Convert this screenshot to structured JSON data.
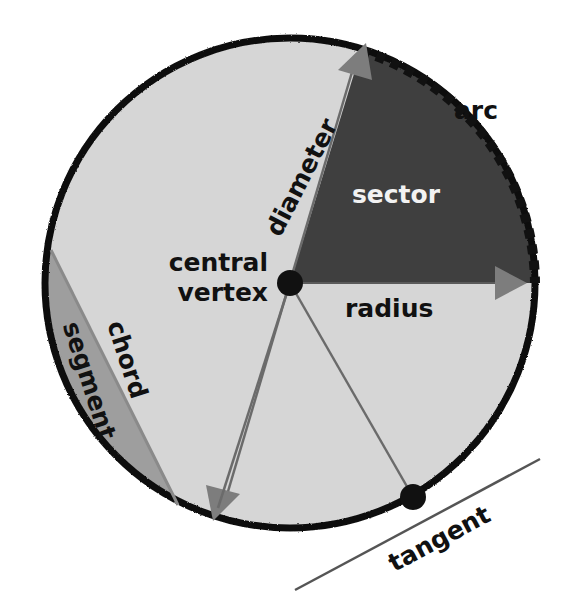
{
  "figure": {
    "kind": "circle-geometry-diagram",
    "canvas": {
      "width": 565,
      "height": 601,
      "background": "#ffffff"
    },
    "circle": {
      "center_x": 290,
      "center_y": 283,
      "radius": 245,
      "fill": "#d6d6d6",
      "stroke": "#111111",
      "stroke_width": 7
    },
    "sector": {
      "fill": "#3f3f3f",
      "start_angle_deg": 0,
      "end_angle_deg": 73,
      "label": "sector",
      "label_color": "#f2f2f2",
      "label_x": 395,
      "label_y": 196
    },
    "segment": {
      "fill": "#9e9e9e",
      "label": "segment",
      "label_rotation_deg": 72,
      "label_x": 88,
      "label_y": 381
    },
    "arc": {
      "label": "arc",
      "label_color": "#111111",
      "label_x": 476,
      "label_y": 112,
      "stroke": "#111111",
      "dash": "9 7",
      "stroke_width": 9
    },
    "radius": {
      "label": "radius",
      "label_color": "#111111",
      "label_x": 345,
      "label_y": 309,
      "arrow_fill": "#7d7d7d",
      "from_x": 290,
      "from_y": 283,
      "to_x": 534,
      "to_y": 283
    },
    "diameter": {
      "label": "diameter",
      "label_color": "#111111",
      "label_rotation_deg": -63,
      "label_x": 303,
      "label_y": 178,
      "arrow_fill": "#7d7d7d",
      "from_x": 362,
      "from_y": 49,
      "to_x": 218,
      "to_y": 516
    },
    "chord": {
      "label": "chord",
      "label_color": "#111111",
      "label_rotation_deg": 72,
      "label_x": 126,
      "label_y": 360
    },
    "tangent": {
      "label": "tangent",
      "label_color": "#111111",
      "label_rotation_deg": 27,
      "label_x": 414,
      "label_y": 540,
      "point_x": 413,
      "point_y": 497,
      "stroke": "#555555"
    },
    "central_vertex": {
      "label_line_1": "central",
      "label_line_2": "vertex",
      "label_color": "#111111",
      "label_x": 270,
      "label_y": 268,
      "dot_x": 290,
      "dot_y": 283,
      "dot_radius": 13,
      "dot_fill": "#111111"
    },
    "guide_lines": {
      "stroke": "#6b6b6b",
      "stroke_width": 2.5
    }
  },
  "labels": {
    "arc": "arc",
    "sector": "sector",
    "radius": "radius",
    "diameter": "diameter",
    "chord": "chord",
    "segment": "segment",
    "tangent": "tangent",
    "central_line_1": "central",
    "central_line_2": "vertex"
  }
}
